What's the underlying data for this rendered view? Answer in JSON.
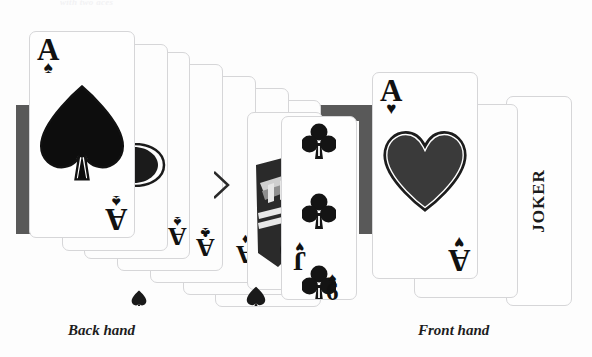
{
  "image": {
    "kind": "photograph-of-playing-cards",
    "background_color": "#fdfdfd",
    "accent_dark": "#595959",
    "ink_color": "#111111"
  },
  "top_caption": {
    "text": "with two aces",
    "note": "clipped at top edge, nearly invisible"
  },
  "captions": {
    "back": "Back hand",
    "front": "Front hand"
  },
  "bars": [
    {
      "name": "left-dark-bar",
      "x": 16,
      "y": 105,
      "w": 16,
      "h": 129,
      "color": "#595959"
    },
    {
      "name": "mid-dark-bar-h",
      "x": 313,
      "y": 105,
      "w": 62,
      "h": 16,
      "color": "#595959"
    },
    {
      "name": "mid-dark-bar-v",
      "x": 359,
      "y": 105,
      "w": 16,
      "h": 129,
      "color": "#595959"
    },
    {
      "name": "right-dark-bar",
      "x": 553,
      "y": 105,
      "w": 16,
      "h": 129,
      "color": "#595959"
    }
  ],
  "back_hand": {
    "label": "Back hand",
    "cards": [
      {
        "name": "ace-of-spades",
        "rank": "A",
        "suit": "spade",
        "suit_glyph": "♠",
        "face_up": true,
        "center_symbol": "spade"
      },
      {
        "name": "ace-of-clubs-1",
        "rank": "A",
        "suit": "club",
        "suit_glyph": "♣",
        "face_up": true,
        "center_symbol": "club"
      },
      {
        "name": "ace-of-clubs-2",
        "rank": "A",
        "suit": "club",
        "suit_glyph": "♣",
        "face_up": true,
        "center_symbol": "club"
      },
      {
        "name": "ace-of-diamonds",
        "rank": "A",
        "suit": "diamond",
        "suit_glyph": "♦",
        "face_up": true,
        "center_symbol": "diamond"
      },
      {
        "name": "ace-of-spades-2",
        "rank": "A",
        "suit": "spade",
        "suit_glyph": "♠",
        "face_up": true,
        "center_symbol": "spade"
      },
      {
        "name": "jack-card",
        "rank": "J",
        "suit": "heart",
        "suit_glyph": "♥",
        "face_up": true,
        "center_symbol": "heart"
      },
      {
        "name": "nine-of-clubs",
        "rank": "9",
        "suit": "club",
        "suit_glyph": "♣",
        "face_up": true,
        "center_symbol": "club"
      },
      {
        "name": "six-of-spades",
        "rank": "6",
        "suit": "spade",
        "suit_glyph": "♠",
        "face_up": true,
        "center_symbol": "spade"
      }
    ]
  },
  "front_hand": {
    "label": "Front hand",
    "cards": [
      {
        "name": "ace-of-hearts",
        "rank": "A",
        "suit": "heart",
        "suit_glyph": "♥",
        "face_up": true,
        "center_symbol": "heart"
      },
      {
        "name": "joker-card",
        "rank": "JOKER",
        "suit": "none",
        "suit_glyph": "",
        "face_up": true,
        "center_symbol": "text"
      }
    ],
    "joker_label": "JOKER"
  }
}
